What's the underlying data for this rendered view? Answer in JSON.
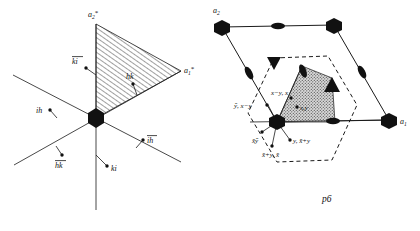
{
  "figure": {
    "title": "",
    "panels": [
      {
        "id": "left-panel",
        "name": "reciprocal-lattice-hexagonal-indices",
        "labels": {
          "a2_star": "a",
          "a2_star_sub": "2",
          "a2_star_mark": "*",
          "a1_star": "a",
          "a1_star_sub": "1",
          "a1_star_mark": "*",
          "ki_bar": "ki",
          "hk": "hk",
          "ih": "ih",
          "ih_bar": "ih",
          "hk_bar": "hk",
          "ki": "ki"
        }
      },
      {
        "id": "right-panel",
        "name": "p6-plane-group-diagram",
        "labels": {
          "a2": "a",
          "a2_sub": "2",
          "a1": "a",
          "a1_sub": "1",
          "group": "p6",
          "coord_xmy_x": "x−y, x",
          "coord_ybar_xmy": "ȳ, x−y",
          "coord_xy": "x,y",
          "coord_xbar_ybar": "x̄ȳ",
          "coord_y_xbary": "y, x̄+y",
          "coord_xbary_xbar": "x̄+y, x̄"
        },
        "symbols": {
          "six_fold": "filled-hexagon",
          "three_fold": "filled-triangle",
          "two_fold": "filled-lens"
        }
      }
    ],
    "colors": {
      "ink": "#111111",
      "hatch": "#333333",
      "stipple": "#8a8a8a"
    }
  }
}
